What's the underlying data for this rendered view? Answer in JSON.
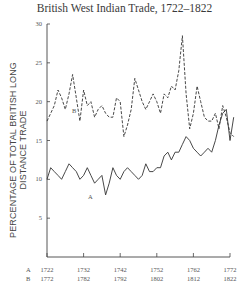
{
  "chart_data": {
    "type": "line",
    "title": "British West Indian Trade, 1722–1822",
    "xlabel": "",
    "ylabel": "PERCENTAGE OF TOTAL BRITISH LONG DISTANCE TRADE",
    "ylim": [
      0,
      30
    ],
    "yticks": [
      "5",
      "10",
      "15",
      "20",
      "25",
      "30"
    ],
    "x_axis_rows": [
      {
        "label": "A",
        "ticks": [
          "1722",
          "1732",
          "1742",
          "1752",
          "1762",
          "1772"
        ]
      },
      {
        "label": "B",
        "ticks": [
          "1772",
          "1782",
          "1792",
          "1802",
          "1812",
          "1822"
        ]
      }
    ],
    "grid": false,
    "series": [
      {
        "name": "A",
        "style": "solid",
        "x_start": 1722,
        "values": [
          10.0,
          11.5,
          11.0,
          10.5,
          10.0,
          11.0,
          12.0,
          11.5,
          11.0,
          10.0,
          10.5,
          11.5,
          10.5,
          9.5,
          10.0,
          10.5,
          8.0,
          9.5,
          11.5,
          10.5,
          10.0,
          11.0,
          11.5,
          11.0,
          10.5,
          10.0,
          10.5,
          12.0,
          11.0,
          11.0,
          11.5,
          11.5,
          13.0,
          13.5,
          12.5,
          13.5,
          13.5,
          14.5,
          15.5,
          15.0,
          14.0,
          13.5,
          13.0,
          13.5,
          14.0,
          13.5,
          15.0,
          17.0,
          18.5,
          19.0,
          15.0,
          18.0
        ]
      },
      {
        "name": "B",
        "style": "dashed",
        "x_start": 1772,
        "values": [
          17.5,
          18.5,
          19.5,
          21.5,
          20.5,
          19.0,
          21.0,
          23.5,
          20.5,
          17.5,
          21.5,
          19.5,
          20.0,
          18.0,
          19.0,
          19.5,
          18.5,
          18.0,
          18.0,
          20.5,
          20.0,
          15.5,
          17.0,
          19.0,
          23.0,
          21.5,
          20.0,
          19.0,
          20.0,
          21.0,
          20.0,
          18.5,
          21.0,
          20.5,
          22.0,
          21.5,
          24.0,
          28.5,
          21.0,
          16.5,
          18.5,
          22.0,
          20.0,
          18.0,
          17.5,
          17.5,
          18.5,
          16.5,
          19.5,
          18.0,
          16.0,
          15.5
        ]
      }
    ],
    "annotations": [
      {
        "text": "A",
        "near": "solid line dip ~1737"
      },
      {
        "text": "B",
        "near": "dashed line ~1781"
      }
    ]
  },
  "annotations": {
    "a_label": "A",
    "b_label": "B"
  }
}
